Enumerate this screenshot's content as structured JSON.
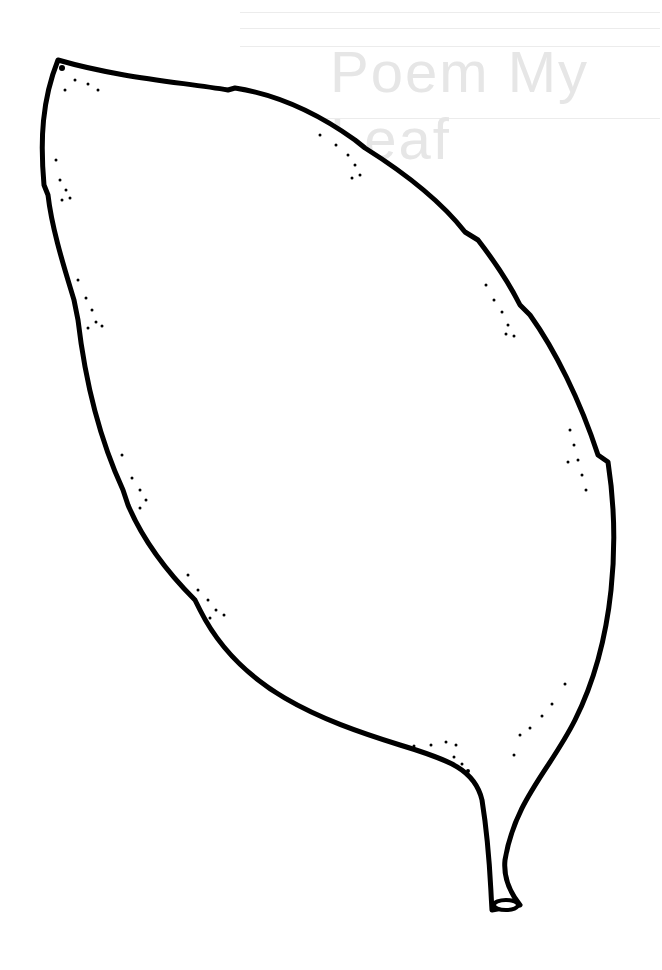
{
  "image": {
    "subject": "leaf outline",
    "style": "black line-art clipart on white",
    "background_color": "#ffffff",
    "stroke_color": "#000000"
  },
  "bleed_through": {
    "text": "Poem My Leaf",
    "color": "#e6e6e6"
  },
  "features": {
    "notches": 10,
    "stipple_clusters": 12,
    "stem": "short stem with open oval tip"
  }
}
